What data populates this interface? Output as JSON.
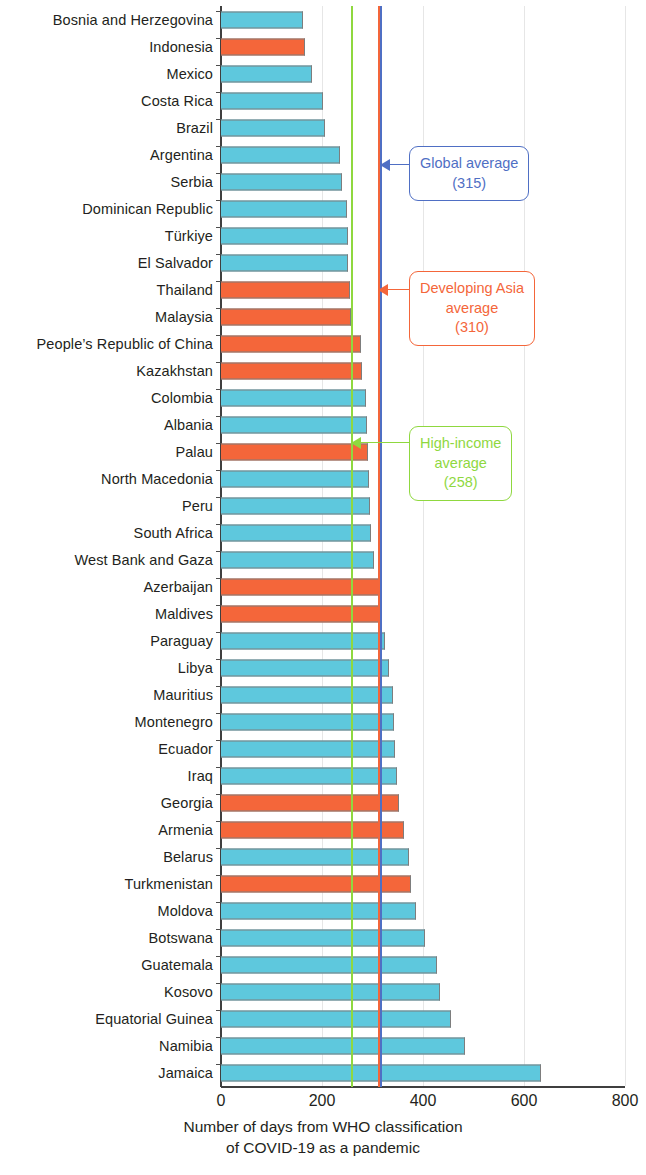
{
  "chart_data": {
    "type": "bar",
    "orientation": "horizontal",
    "title": "",
    "xlabel": "Number of days from WHO classification of COVID-19 as a pandemic",
    "xlabel_lines": [
      "Number of days from WHO classification",
      "of COVID-19 as a pandemic"
    ],
    "ylabel": "",
    "xlim": [
      0,
      800
    ],
    "xticks": [
      0,
      200,
      400,
      600,
      800
    ],
    "xtick_labels": [
      "0",
      "200",
      "400",
      "600",
      "800"
    ],
    "grid": true,
    "legend": "none",
    "colors": {
      "other_economies": "#5ec8dd",
      "developing_asia": "#f4663a",
      "global_average_line": "#4f6fc4",
      "developing_asia_average_line": "#f4663a",
      "high_income_average_line": "#8fd83f",
      "bar_outline": "#7d7d7d",
      "axis": "#3f3f3f",
      "text": "#231f20"
    },
    "categories": [
      "Bosnia and Herzegovina",
      "Indonesia",
      "Mexico",
      "Costa Rica",
      "Brazil",
      "Argentina",
      "Serbia",
      "Dominican Republic",
      "Türkiye",
      "El Salvador",
      "Thailand",
      "Malaysia",
      "People’s Republic of China",
      "Kazakhstan",
      "Colombia",
      "Albania",
      "Palau",
      "North Macedonia",
      "Peru",
      "South Africa",
      "West Bank and Gaza",
      "Azerbaijan",
      "Maldives",
      "Paraguay",
      "Libya",
      "Mauritius",
      "Montenegro",
      "Ecuador",
      "Iraq",
      "Georgia",
      "Armenia",
      "Belarus",
      "Turkmenistan",
      "Moldova",
      "Botswana",
      "Guatemala",
      "Kosovo",
      "Equatorial Guinea",
      "Namibia",
      "Jamaica"
    ],
    "values": [
      162,
      166,
      180,
      202,
      206,
      236,
      240,
      250,
      252,
      252,
      255,
      258,
      277,
      279,
      288,
      290,
      292,
      294,
      296,
      298,
      303,
      312,
      314,
      325,
      332,
      340,
      342,
      344,
      348,
      352,
      362,
      372,
      376,
      386,
      404,
      428,
      434,
      456,
      484,
      634
    ],
    "series_group": [
      "other",
      "developing_asia",
      "other",
      "other",
      "other",
      "other",
      "other",
      "other",
      "other",
      "other",
      "developing_asia",
      "developing_asia",
      "developing_asia",
      "developing_asia",
      "other",
      "other",
      "developing_asia",
      "other",
      "other",
      "other",
      "other",
      "developing_asia",
      "developing_asia",
      "other",
      "other",
      "other",
      "other",
      "other",
      "other",
      "developing_asia",
      "developing_asia",
      "other",
      "developing_asia",
      "other",
      "other",
      "other",
      "other",
      "other",
      "other",
      "other"
    ],
    "reference_lines": [
      {
        "id": "global",
        "label": "Global average",
        "value_label": "(315)",
        "value": 315,
        "color": "#4f6fc4"
      },
      {
        "id": "developing_asia",
        "label": "Developing Asia average",
        "value_label": "(310)",
        "value": 310,
        "color": "#f4663a"
      },
      {
        "id": "high_income",
        "label": "High-income average",
        "value_label": "(258)",
        "value": 258,
        "color": "#8fd83f"
      }
    ],
    "annotations": [
      {
        "id": "global-average-callout",
        "lines": [
          "Global average",
          "(315)"
        ],
        "color": "#4f6fc4"
      },
      {
        "id": "developing-asia-average-callout",
        "lines": [
          "Developing Asia",
          "average",
          "(310)"
        ],
        "color": "#f4663a"
      },
      {
        "id": "high-income-average-callout",
        "lines": [
          "High-income",
          "average",
          "(258)"
        ],
        "color": "#8fd83f"
      }
    ]
  }
}
